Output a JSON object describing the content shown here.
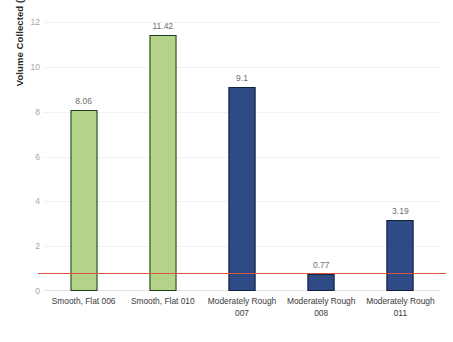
{
  "chart_data": {
    "type": "bar",
    "title": "",
    "xlabel": "",
    "ylabel": "Volume Collected (cc)",
    "ylim": [
      0,
      12
    ],
    "yticks": [
      "0",
      "2",
      "4",
      "6",
      "8",
      "10",
      "12"
    ],
    "grid": true,
    "legend": "none",
    "categories": [
      "Smooth, Flat 006",
      "Smooth, Flat 010",
      "Moderately Rough 007",
      "Moderately Rough 008",
      "Moderately Rough 011"
    ],
    "category_lines": [
      [
        "Smooth, Flat 006",
        ""
      ],
      [
        "Smooth, Flat 010",
        ""
      ],
      [
        "Moderately Rough",
        "007"
      ],
      [
        "Moderately Rough",
        "008"
      ],
      [
        "Moderately Rough",
        "011"
      ]
    ],
    "values": [
      8.06,
      11.42,
      9.1,
      0.77,
      3.19
    ],
    "value_labels": [
      "8.06",
      "11.42",
      "9.1",
      "0.77",
      "3.19"
    ],
    "bar_colors": [
      "green",
      "green",
      "blue",
      "blue",
      "blue"
    ],
    "annotations": [
      {
        "name": "threshold-line",
        "type": "hline",
        "value": 0.8,
        "color": "#d9553c"
      }
    ]
  },
  "colors": {
    "green_fill": "#b4d288",
    "green_border": "#1f3d20",
    "blue_fill": "#2e4b86",
    "blue_border": "#13213d",
    "threshold": "#d9553c",
    "gridline": "#f1f1f1",
    "tick_text": "#a6a6a6",
    "label_text": "#3a3a3a",
    "background": "#ffffff"
  }
}
